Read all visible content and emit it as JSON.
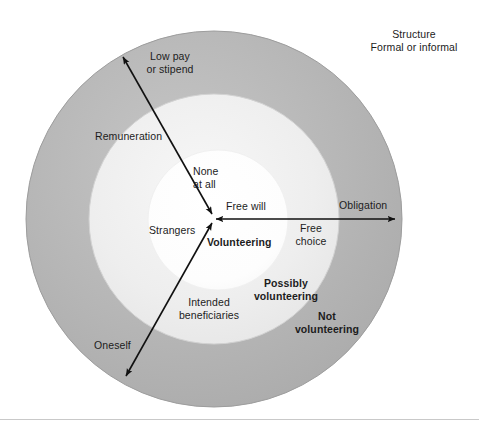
{
  "figure": {
    "type": "concentric-venn-diagram",
    "title_note": "Volunteering conceptual rings diagram",
    "rings": [
      {
        "name": "inner",
        "label": "Volunteering",
        "fill": "#ffffff",
        "radius": 70
      },
      {
        "name": "middle",
        "label": "Possibly volunteering",
        "fill": "#eeeeee",
        "radius": 125
      },
      {
        "name": "outer",
        "label": "Not volunteering",
        "fill": "#b2b2b2",
        "radius": 188
      }
    ],
    "center": {
      "x": 214,
      "y": 219
    },
    "stroke": "#8f8f8f"
  },
  "labels": {
    "structure": "Structure\nFormal or informal",
    "low_pay": "Low pay\nor stipend",
    "remuneration": "Remuneration",
    "none_at_all": "None\nat all",
    "free_will": "Free will",
    "strangers": "Strangers",
    "volunteering": "Volunteering",
    "obligation": "Obligation",
    "free_choice": "Free\nchoice",
    "possibly_volunteering": "Possibly\nvolunteering",
    "intended_beneficiaries": "Intended\nbeneficiaries",
    "not_volunteering": "Not\nvolunteering",
    "oneself": "Oneself"
  },
  "axes": [
    {
      "name": "remuneration-axis",
      "label": "Remuneration",
      "inner_end_label": "None at all",
      "outer_end_label": "Low pay or stipend",
      "from": {
        "x": 122,
        "y": 56
      },
      "to": {
        "x": 214,
        "y": 216
      },
      "double_headed": true
    },
    {
      "name": "free-will-axis",
      "label": "",
      "inner_end_label": "Free will",
      "outer_end_label": "Obligation",
      "mid_label": "Free choice",
      "from": {
        "x": 214,
        "y": 219
      },
      "to": {
        "x": 397,
        "y": 219
      },
      "double_headed": true
    },
    {
      "name": "beneficiary-axis",
      "label": "Intended beneficiaries",
      "inner_end_label": "Strangers",
      "outer_end_label": "Oneself",
      "from": {
        "x": 214,
        "y": 222
      },
      "to": {
        "x": 124,
        "y": 378
      },
      "double_headed": true
    }
  ],
  "colors": {
    "outer_ring": "#b2b2b2",
    "middle_ring": "#eeeeee",
    "inner_circle": "#ffffff",
    "ring_stroke": "#8f8f8f",
    "arrow": "#111111",
    "text": "#1c1c1c",
    "footer_rule": "#c9c9c9",
    "background": "#ffffff"
  }
}
